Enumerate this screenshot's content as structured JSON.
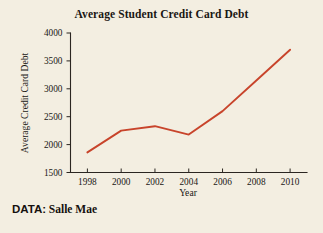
{
  "figure": {
    "background_color": "#f3eee1",
    "source_prefix": "DATA:",
    "source_name": "Salle Mae"
  },
  "chart_data": {
    "type": "line",
    "title": "Average Student Credit Card Debt",
    "xlabel": "Year",
    "ylabel": "Average Credit Card Debt",
    "x": [
      1998,
      2000,
      2002,
      2004,
      2006,
      2008,
      2010
    ],
    "values": [
      1860,
      2250,
      2330,
      2180,
      2600,
      3150,
      3700
    ],
    "xlim": [
      1997,
      2011
    ],
    "ylim": [
      1500,
      4000
    ],
    "xticks": [
      1998,
      2000,
      2002,
      2004,
      2006,
      2008,
      2010
    ],
    "xtick_labels": [
      "1998",
      "2000",
      "2002",
      "2004",
      "2006",
      "2008",
      "2010"
    ],
    "yticks": [
      1500,
      2000,
      2500,
      3000,
      3500,
      4000
    ],
    "ytick_labels": [
      "1500",
      "2000",
      "2500",
      "3000",
      "3500",
      "4000"
    ],
    "grid": false,
    "legend": false,
    "series_color": "#c8442b",
    "axis_color": "#2b2621"
  }
}
